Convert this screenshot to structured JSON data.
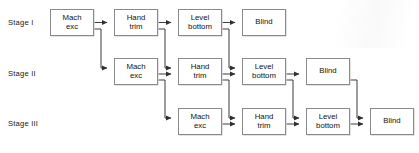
{
  "diagram": {
    "type": "flowchart",
    "stage_labels": [
      {
        "id": "stage-1",
        "text": "Stage I",
        "x": 8,
        "y": 21
      },
      {
        "id": "stage-2",
        "text": "Stage II",
        "x": 8,
        "y": 68
      },
      {
        "id": "stage-3",
        "text": "Stage III",
        "x": 8,
        "y": 117
      }
    ],
    "activities": [
      "Mach exc",
      "Hand trim",
      "Level bottom",
      "Blind"
    ],
    "nodes": [
      {
        "id": "s1-mach-exc",
        "stage": 1,
        "activity": "mach-exc",
        "label": "Mach\nexc",
        "x": 50,
        "y": 9,
        "w": 44,
        "h": 27
      },
      {
        "id": "s1-hand-trim",
        "stage": 1,
        "activity": "hand-trim",
        "label": "Hand\ntrim",
        "x": 114,
        "y": 9,
        "w": 44,
        "h": 27
      },
      {
        "id": "s1-level-bottom",
        "stage": 1,
        "activity": "level-bottom",
        "label": "Level\nbottom",
        "x": 178,
        "y": 9,
        "w": 44,
        "h": 27
      },
      {
        "id": "s1-blind",
        "stage": 1,
        "activity": "blind",
        "label": "Blind",
        "x": 242,
        "y": 9,
        "w": 44,
        "h": 27
      },
      {
        "id": "s2-mach-exc",
        "stage": 2,
        "activity": "mach-exc",
        "label": "Mach\nexc",
        "x": 114,
        "y": 58,
        "w": 44,
        "h": 27
      },
      {
        "id": "s2-hand-trim",
        "stage": 2,
        "activity": "hand-trim",
        "label": "Hand\ntrim",
        "x": 178,
        "y": 58,
        "w": 44,
        "h": 27
      },
      {
        "id": "s2-level-bottom",
        "stage": 2,
        "activity": "level-bottom",
        "label": "Level\nbottom",
        "x": 242,
        "y": 58,
        "w": 44,
        "h": 27
      },
      {
        "id": "s2-blind",
        "stage": 2,
        "activity": "blind",
        "label": "Blind",
        "x": 306,
        "y": 58,
        "w": 44,
        "h": 27
      },
      {
        "id": "s3-mach-exc",
        "stage": 3,
        "activity": "mach-exc",
        "label": "Mach\nexc",
        "x": 178,
        "y": 108,
        "w": 44,
        "h": 27
      },
      {
        "id": "s3-hand-trim",
        "stage": 3,
        "activity": "hand-trim",
        "label": "Hand\ntrim",
        "x": 242,
        "y": 108,
        "w": 44,
        "h": 27
      },
      {
        "id": "s3-level-bottom",
        "stage": 3,
        "activity": "level-bottom",
        "label": "Level\nbottom",
        "x": 306,
        "y": 108,
        "w": 44,
        "h": 27
      },
      {
        "id": "s3-blind",
        "stage": 3,
        "activity": "blind",
        "label": "Blind",
        "x": 370,
        "y": 108,
        "w": 44,
        "h": 27
      }
    ],
    "edges": [
      {
        "id": "e-s1-mach-to-s1-hand",
        "from": "s1-mach-exc",
        "to": "s1-hand-trim",
        "kind": "horizontal"
      },
      {
        "id": "e-s1-hand-to-s1-level",
        "from": "s1-hand-trim",
        "to": "s1-level-bottom",
        "kind": "horizontal"
      },
      {
        "id": "e-s1-level-to-s1-blind",
        "from": "s1-level-bottom",
        "to": "s1-blind",
        "kind": "horizontal"
      },
      {
        "id": "e-s2-mach-to-s2-hand",
        "from": "s2-mach-exc",
        "to": "s2-hand-trim",
        "kind": "horizontal"
      },
      {
        "id": "e-s2-hand-to-s2-level",
        "from": "s2-hand-trim",
        "to": "s2-level-bottom",
        "kind": "horizontal"
      },
      {
        "id": "e-s2-level-to-s2-blind",
        "from": "s2-level-bottom",
        "to": "s2-blind",
        "kind": "horizontal"
      },
      {
        "id": "e-s3-mach-to-s3-hand",
        "from": "s3-mach-exc",
        "to": "s3-hand-trim",
        "kind": "horizontal"
      },
      {
        "id": "e-s3-hand-to-s3-level",
        "from": "s3-hand-trim",
        "to": "s3-level-bottom",
        "kind": "horizontal"
      },
      {
        "id": "e-s3-level-to-s3-blind",
        "from": "s3-level-bottom",
        "to": "s3-blind",
        "kind": "horizontal"
      },
      {
        "id": "e-s1-mach-to-s2-mach",
        "from": "s1-mach-exc",
        "to": "s2-mach-exc",
        "kind": "elbow-down"
      },
      {
        "id": "e-s1-hand-to-s2-hand",
        "from": "s1-hand-trim",
        "to": "s2-hand-trim",
        "kind": "elbow-down"
      },
      {
        "id": "e-s1-level-to-s2-level",
        "from": "s1-level-bottom",
        "to": "s2-level-bottom",
        "kind": "elbow-down"
      },
      {
        "id": "e-s2-mach-to-s3-mach",
        "from": "s2-mach-exc",
        "to": "s3-mach-exc",
        "kind": "elbow-down"
      },
      {
        "id": "e-s2-hand-to-s3-hand",
        "from": "s2-hand-trim",
        "to": "s3-hand-trim",
        "kind": "elbow-down"
      },
      {
        "id": "e-s2-level-to-s3-level",
        "from": "s2-level-bottom",
        "to": "s3-level-bottom",
        "kind": "elbow-down"
      },
      {
        "id": "e-s2-blind-to-s3-blind",
        "from": "s2-blind",
        "to": "s3-blind",
        "kind": "elbow-down"
      }
    ],
    "colors": {
      "box_border": "#8a8a8a",
      "box_fill": "#ffffff",
      "line": "#3a3a3a",
      "text": "#111111",
      "background": "#ffffff"
    }
  }
}
